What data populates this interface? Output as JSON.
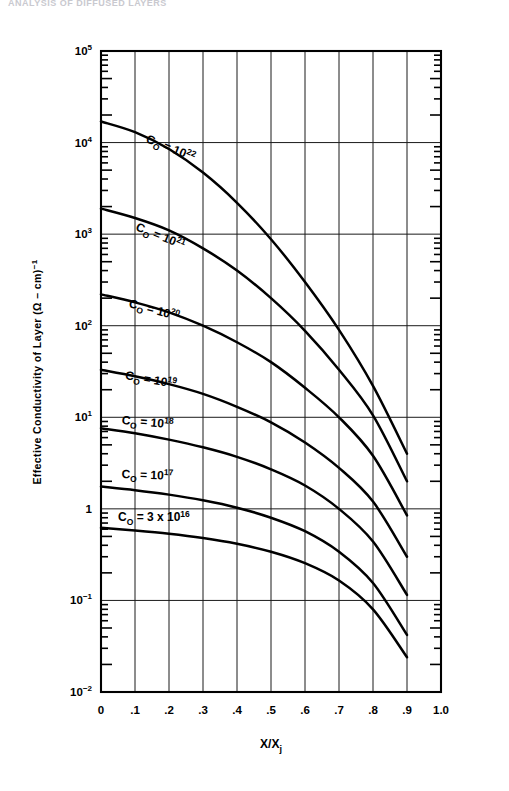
{
  "page": {
    "header_text": "ANALYSIS OF DIFFUSED LAYERS"
  },
  "chart_data": {
    "type": "line",
    "title": "",
    "xlabel": "X/Xj",
    "ylabel": "Effective Conductivity of Layer (Ω – cm)⁻¹",
    "xlim": [
      0,
      1.0
    ],
    "ylim": [
      0.01,
      100000
    ],
    "yscale": "log",
    "xscale": "linear",
    "grid": true,
    "legend_position": "inline-curve-labels",
    "x_ticks": [
      "0",
      ".1",
      ".2",
      ".3",
      ".4",
      ".5",
      ".6",
      ".7",
      ".8",
      ".9",
      "1.0"
    ],
    "x_tick_values": [
      0,
      0.1,
      0.2,
      0.3,
      0.4,
      0.5,
      0.6,
      0.7,
      0.8,
      0.9,
      1.0
    ],
    "y_ticks": [
      "10⁵",
      "10⁴",
      "10³",
      "10²",
      "10¹",
      "1",
      "10⁻¹",
      "10⁻²"
    ],
    "y_tick_values": [
      100000,
      10000,
      1000,
      100,
      10,
      1,
      0.1,
      0.01
    ],
    "y_tick_parts": [
      {
        "base": "10",
        "exp": "5"
      },
      {
        "base": "10",
        "exp": "4"
      },
      {
        "base": "10",
        "exp": "3"
      },
      {
        "base": "10",
        "exp": "2"
      },
      {
        "base": "10",
        "exp": "1"
      },
      {
        "base": "1",
        "exp": ""
      },
      {
        "base": "10",
        "exp": "−1"
      },
      {
        "base": "10",
        "exp": "−2"
      }
    ],
    "x": [
      0,
      0.1,
      0.2,
      0.3,
      0.4,
      0.5,
      0.6,
      0.7,
      0.8,
      0.9
    ],
    "series": [
      {
        "name": "CO = 10^22",
        "label_base": "C",
        "label_sub": "O",
        "label_eq": " = 10",
        "label_sup": "22",
        "values": [
          17000,
          13000,
          8500,
          4700,
          2200,
          880,
          300,
          90,
          22,
          4.0
        ]
      },
      {
        "name": "CO = 10^21",
        "label_base": "C",
        "label_sub": "O",
        "label_eq": " = 10",
        "label_sup": "21",
        "values": [
          1900,
          1500,
          1100,
          700,
          400,
          200,
          88,
          33,
          10.5,
          2.0
        ]
      },
      {
        "name": "CO = 10^20",
        "label_base": "C",
        "label_sub": "O",
        "label_eq": " = 10",
        "label_sup": "20",
        "values": [
          220,
          180,
          140,
          100,
          66,
          40,
          21,
          10.0,
          3.8,
          0.85
        ]
      },
      {
        "name": "CO = 10^19",
        "label_base": "C",
        "label_sub": "O",
        "label_eq": " = 10",
        "label_sup": "19",
        "values": [
          33,
          28,
          23,
          18,
          13,
          8.8,
          5.3,
          2.8,
          1.2,
          0.3
        ]
      },
      {
        "name": "CO = 10^18",
        "label_base": "C",
        "label_sub": "O",
        "label_eq": " = 10",
        "label_sup": "18",
        "values": [
          7.6,
          6.7,
          5.7,
          4.7,
          3.7,
          2.7,
          1.8,
          1.0,
          0.44,
          0.115
        ]
      },
      {
        "name": "CO = 10^17",
        "label_base": "C",
        "label_sub": "O",
        "label_eq": " = 10",
        "label_sup": "17",
        "values": [
          1.75,
          1.6,
          1.43,
          1.24,
          1.03,
          0.8,
          0.57,
          0.34,
          0.155,
          0.042
        ]
      },
      {
        "name": "CO = 3 x 10^16",
        "label_base": "C",
        "label_sub": "O",
        "label_eq": " = 3 x 10",
        "label_sup": "16",
        "values": [
          0.62,
          0.58,
          0.535,
          0.48,
          0.415,
          0.34,
          0.255,
          0.165,
          0.08,
          0.024
        ]
      }
    ],
    "annotations": [
      {
        "text": "CO = 10^22",
        "x": 0.13,
        "y_px": 142,
        "rotate": 22
      },
      {
        "text": "CO = 10^21",
        "x": 0.1,
        "y_px": 230,
        "rotate": 22
      },
      {
        "text": "CO = 10^20",
        "x": 0.08,
        "y_px": 307,
        "rotate": 15
      },
      {
        "text": "CO = 10^19",
        "x": 0.07,
        "y_px": 379,
        "rotate": 10
      },
      {
        "text": "CO = 10^18",
        "x": 0.06,
        "y_px": 424,
        "rotate": 5
      },
      {
        "text": "CO = 10^17",
        "x": 0.06,
        "y_px": 478,
        "rotate": 2
      },
      {
        "text": "CO = 3 x 10^16",
        "x": 0.05,
        "y_px": 521,
        "rotate": 0
      }
    ]
  },
  "colors": {
    "ink": "#000000",
    "grid": "#1a1a1a",
    "background": "#ffffff",
    "header": "#c9c9cf"
  }
}
